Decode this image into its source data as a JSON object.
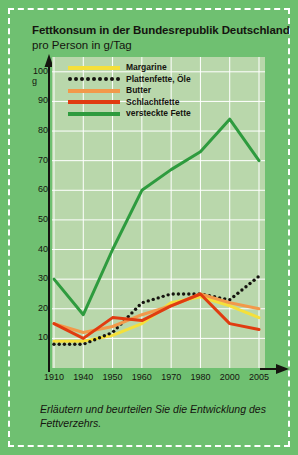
{
  "title": "Fettkonsum in der Bundesrepublik Deutschland",
  "subtitle": "pro Person in g/Tag",
  "caption": "Erläutern und beurteilen Sie die Entwicklung des Fettverzehrs.",
  "y_unit": "g",
  "colors": {
    "margarine": "#f5e03a",
    "plattenfette": "#15140f",
    "butter": "#f2994a",
    "schlachtfette": "#e03c10",
    "versteckte": "#2e9b3e",
    "plot_background": "#b9d7ab",
    "card_background": "#6fc071",
    "grid": "#ffffff",
    "text": "#15140f"
  },
  "legend": {
    "items": [
      {
        "label": "Margarine",
        "style": "solid",
        "color": "#f5e03a"
      },
      {
        "label": "Plattenfette, Öle",
        "style": "dotted",
        "color": "#15140f"
      },
      {
        "label": "Butter",
        "style": "solid",
        "color": "#f2994a"
      },
      {
        "label": "Schlachtfette",
        "style": "solid",
        "color": "#e03c10"
      },
      {
        "label": "versteckte Fette",
        "style": "solid",
        "color": "#2e9b3e"
      }
    ]
  },
  "chart_data": {
    "type": "line",
    "title": "Fettkonsum in der Bundesrepublik Deutschland",
    "subtitle": "pro Person in g/Tag",
    "xlabel": "",
    "ylabel": "g",
    "ylim": [
      0,
      105
    ],
    "yticks": [
      10,
      20,
      30,
      40,
      50,
      60,
      70,
      80,
      90,
      100
    ],
    "grid": true,
    "legend_position": "top-inside",
    "categories": [
      "1910",
      "1940",
      "1950",
      "1960",
      "1970",
      "1980",
      "2000",
      "2005"
    ],
    "x": [
      1910,
      1940,
      1950,
      1960,
      1970,
      1980,
      2000,
      2005
    ],
    "series": [
      {
        "name": "Margarine",
        "color": "#f5e03a",
        "style": "solid",
        "values": [
          9,
          9,
          11,
          15,
          22,
          24,
          21,
          17
        ]
      },
      {
        "name": "Plattenfette, Öle",
        "color": "#15140f",
        "style": "dotted",
        "values": [
          8,
          8,
          12,
          22,
          25,
          25,
          23,
          31
        ]
      },
      {
        "name": "Butter",
        "color": "#f2994a",
        "style": "solid",
        "values": [
          15,
          12,
          14,
          18,
          21,
          25,
          22,
          20
        ]
      },
      {
        "name": "Schlachtfette",
        "color": "#e03c10",
        "style": "solid",
        "values": [
          15,
          10,
          17,
          16,
          21,
          25,
          15,
          13
        ]
      },
      {
        "name": "versteckte Fette",
        "color": "#2e9b3e",
        "style": "solid",
        "values": [
          30,
          18,
          40,
          60,
          67,
          73,
          84,
          70
        ]
      }
    ]
  }
}
